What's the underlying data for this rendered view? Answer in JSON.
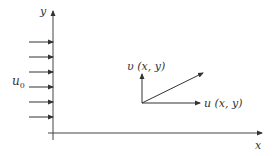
{
  "diagram": {
    "axes": {
      "x_label": "x",
      "y_label": "y"
    },
    "inflow": {
      "label": "u",
      "subscript": "0",
      "arrow_count": 6
    },
    "velocity": {
      "v_label": "υ (x, y)",
      "u_label": "u (x, y)"
    },
    "colors": {
      "stroke": "#333333"
    }
  }
}
